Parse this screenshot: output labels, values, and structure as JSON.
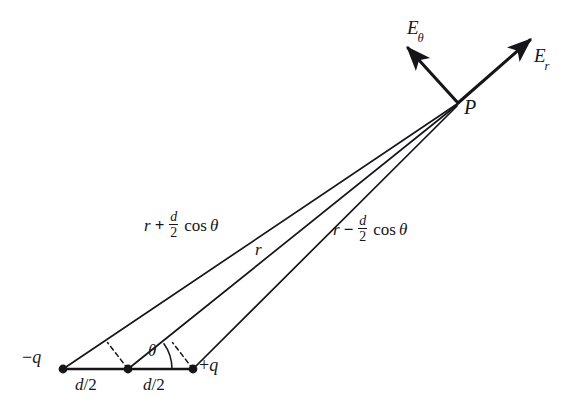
{
  "figure": {
    "type": "physics-vector-diagram",
    "background_color": "#ffffff",
    "ink_color": "#16161a",
    "width": 582,
    "height": 416
  },
  "points": {
    "negative_charge": {
      "label": "-q",
      "sign": "−",
      "symbol": "q",
      "x": 63,
      "y": 369
    },
    "dipole_center": {
      "label": "",
      "x": 128,
      "y": 369
    },
    "positive_charge": {
      "label": "+q",
      "sign": "+",
      "symbol": "q",
      "x": 193,
      "y": 369
    },
    "field_point": {
      "label": "P",
      "x": 458,
      "y": 103
    }
  },
  "vectors": {
    "e_theta": {
      "label": "E",
      "subscript": "θ",
      "from_x": 458,
      "from_y": 103,
      "to_x": 404,
      "to_y": 44
    },
    "e_r": {
      "label": "E",
      "subscript": "r",
      "from_x": 458,
      "from_y": 103,
      "to_x": 535,
      "to_y": 36
    }
  },
  "distance_labels": {
    "from_negative": {
      "base": "r",
      "operator": "+",
      "numerator": "d",
      "denominator": "2",
      "trig": "cos",
      "angle": "θ",
      "plain": "r + d/2 cos θ"
    },
    "center": {
      "base": "r",
      "plain": "r"
    },
    "from_positive": {
      "base": "r",
      "operator": "−",
      "numerator": "d",
      "denominator": "2",
      "trig": "cos",
      "angle": "θ",
      "plain": "r − d/2 cos θ"
    }
  },
  "separations": {
    "left_half": {
      "text": "d/2",
      "numerator": "d",
      "denominator": "2"
    },
    "right_half": {
      "text": "d/2",
      "numerator": "d",
      "denominator": "2"
    }
  },
  "angle": {
    "symbol": "θ",
    "vertex_x": 128,
    "vertex_y": 369,
    "description": "angle between dipole axis and line to P"
  },
  "construction_lines": {
    "dashed_left": {
      "x1": 128,
      "y1": 369,
      "x2": 107,
      "y2": 343
    },
    "dashed_right": {
      "x1": 193,
      "y1": 369,
      "x2": 172,
      "y2": 343
    }
  }
}
